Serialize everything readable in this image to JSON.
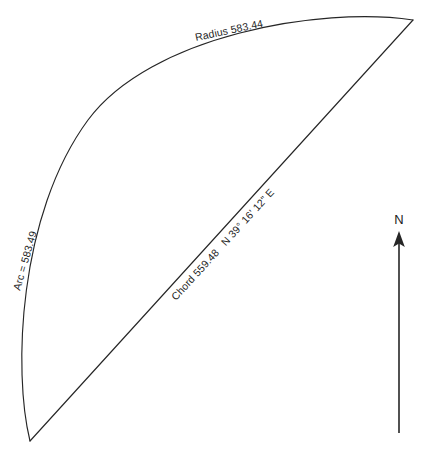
{
  "figure": {
    "background_color": "#ffffff",
    "line_color": "#262626"
  },
  "labels": {
    "radius": "Radius 583.44",
    "arc": "Arc = 583.49",
    "chord": "Chord 559.48   N 39° 16' 12\" E",
    "chord_length": "Chord 559.48",
    "chord_bearing": "N 39° 16' 12\" E",
    "north": "N"
  },
  "geometry": {
    "apex_point": "413,20",
    "base_point": "30,441",
    "arc_bulge_x": 20,
    "chord_label_angle_deg": -47.6,
    "radius_label_angle_deg": -12,
    "arc_label_angle_deg": -74
  },
  "north_arrow": {
    "shaft_x": 399,
    "shaft_top_y": 233,
    "shaft_bottom_y": 433,
    "label_y": 224
  },
  "values": {
    "radius": 583.44,
    "arc_length": 583.49,
    "chord_length": 559.48,
    "bearing_degrees": 39,
    "bearing_minutes": 16,
    "bearing_seconds": 12,
    "bearing_quadrant_from": "N",
    "bearing_quadrant_to": "E"
  }
}
